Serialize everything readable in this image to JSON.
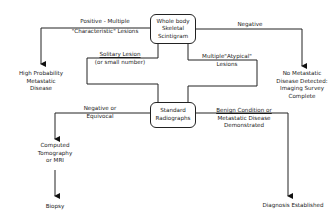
{
  "diagram": {
    "nodes": {
      "scintigram": {
        "lines": [
          "Whole body",
          "Skeletal",
          "Scintigram"
        ]
      },
      "radiographs": {
        "lines": [
          "Standard",
          "Radiographs"
        ]
      },
      "high_prob": {
        "lines": [
          "High  Probability",
          "Metastatic",
          "Disease"
        ]
      },
      "no_meta": {
        "lines": [
          "No  Metastatic",
          "Disease  Detected:",
          "Imaging  Survey",
          "Complete"
        ]
      },
      "ct_mri": {
        "lines": [
          "Computed",
          "Tomography",
          "or  MRI"
        ]
      },
      "biopsy": {
        "lines": [
          "Biopsy"
        ]
      },
      "diagnosis": {
        "lines": [
          "Diagnosis   Established"
        ]
      }
    },
    "edges": {
      "positive": {
        "lines": [
          "Positive  -  Multiple",
          "\"Characteristic\"   Lesions"
        ]
      },
      "negative": {
        "lines": [
          "Negative"
        ]
      },
      "solitary": {
        "lines": [
          "Solitary   Lesion",
          "(or  small  number)"
        ]
      },
      "atypical": {
        "lines": [
          "Multiple\"Atypical\"",
          "Lesions"
        ]
      },
      "neg_equivocal": {
        "lines": [
          "Negative  or",
          "Equivocal"
        ]
      },
      "benign": {
        "lines": [
          "Benign  Condition  or",
          "Metastatic   Disease",
          "Demonstrated"
        ]
      }
    }
  }
}
